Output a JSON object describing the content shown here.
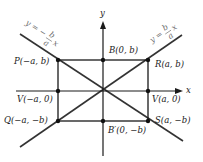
{
  "diagram": {
    "axes": {
      "x_label": "x",
      "y_label": "y"
    },
    "asymptotes": [
      {
        "name": "negative-slope",
        "lhs": "y =",
        "sign": "−",
        "num": "b",
        "den": "a",
        "var": "x"
      },
      {
        "name": "positive-slope",
        "lhs": "y =",
        "sign": "",
        "num": "b",
        "den": "a",
        "var": "x"
      }
    ],
    "points": {
      "P": "P(−a, b)",
      "B": "B(0, b)",
      "R": "R(a, b)",
      "V_left": "V(−a, 0)",
      "V_right": "V(a, 0)",
      "Q": "Q(−a, −b)",
      "B_prime": "B′(0, −b)",
      "S": "S(a, −b)"
    },
    "colors": {
      "line": "#1a1a1a",
      "asymptote": "#333333",
      "equation_text": "#6b6b6b"
    }
  }
}
